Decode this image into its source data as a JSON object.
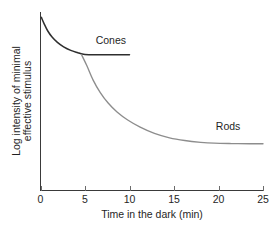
{
  "chart_data": {
    "type": "line",
    "title": "",
    "xlabel": "Time in the dark (min)",
    "ylabel_line1": "Log intensity of minimal",
    "ylabel_line2": "effective stimulus",
    "xlim": [
      0,
      25
    ],
    "ylim": [
      0,
      10
    ],
    "xticks": [
      0,
      5,
      10,
      15,
      20,
      25
    ],
    "xticklabels": [
      "0",
      "5",
      "10",
      "15",
      "20",
      "25"
    ],
    "yticks": [],
    "yticklabels": [],
    "grid": false,
    "legend_position": "inline-annotations",
    "annotations": [
      {
        "text": "Cones",
        "x": 6.2,
        "y": 8.2
      },
      {
        "text": "Rods",
        "x": 19.7,
        "y": 3.4
      }
    ],
    "series": [
      {
        "name": "Cones",
        "color": "#2e2e2e",
        "points": [
          [
            0.1,
            9.7
          ],
          [
            0.4,
            9.35
          ],
          [
            0.8,
            8.95
          ],
          [
            1.3,
            8.6
          ],
          [
            1.9,
            8.3
          ],
          [
            2.6,
            8.05
          ],
          [
            3.4,
            7.85
          ],
          [
            4.2,
            7.72
          ],
          [
            4.6,
            7.66
          ],
          [
            5.0,
            7.62
          ],
          [
            6.0,
            7.6
          ],
          [
            7.5,
            7.6
          ],
          [
            9.0,
            7.6
          ],
          [
            10.0,
            7.6
          ]
        ]
      },
      {
        "name": "Rods",
        "color": "#8d8d8d",
        "points": [
          [
            4.6,
            7.62
          ],
          [
            5.2,
            7.0
          ],
          [
            5.9,
            6.2
          ],
          [
            6.7,
            5.5
          ],
          [
            7.6,
            4.9
          ],
          [
            8.6,
            4.4
          ],
          [
            9.8,
            3.95
          ],
          [
            11.2,
            3.55
          ],
          [
            12.8,
            3.2
          ],
          [
            14.5,
            2.95
          ],
          [
            16.2,
            2.8
          ],
          [
            18.0,
            2.7
          ],
          [
            19.5,
            2.65
          ],
          [
            21.5,
            2.63
          ],
          [
            23.5,
            2.62
          ],
          [
            25.0,
            2.62
          ]
        ]
      }
    ]
  },
  "axes": {
    "x_axis_name": "x-axis",
    "y_axis_name": "y-axis"
  }
}
